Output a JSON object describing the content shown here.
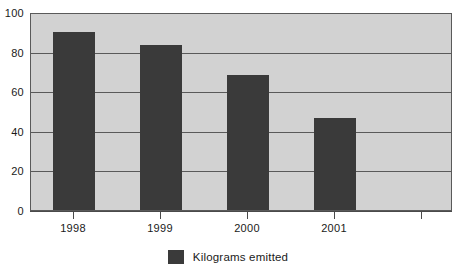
{
  "chart_data": {
    "type": "bar",
    "title": "",
    "subtitle": "",
    "xlabel": "",
    "ylabel": "",
    "categories": [
      "1998",
      "1999",
      "2000",
      "2001"
    ],
    "values": [
      91,
      84,
      69,
      47
    ],
    "series": [
      {
        "name": "Kilograms emitted",
        "values": [
          91,
          84,
          69,
          47
        ],
        "color": "#3a3a3a"
      }
    ],
    "ylim": [
      0,
      100
    ],
    "yticks": [
      0,
      20,
      40,
      60,
      80,
      100
    ],
    "ytick_labels": [
      "0",
      "20",
      "40",
      "60",
      "80",
      "100"
    ],
    "xtick_labels": [
      "1998",
      "1999",
      "2000",
      "2001"
    ],
    "empty_trailing_category": true,
    "grid": true,
    "grid_axis": "y",
    "legend": {
      "position": "bottom-center",
      "entries": [
        {
          "label": "Kilograms emitted",
          "color": "#3a3a3a"
        }
      ]
    },
    "plot_background": "#d2d2d2",
    "figure_background": "#ffffff",
    "axis_color": "#5a5a5a"
  },
  "legend": {
    "label": "Kilograms emitted"
  },
  "axes": {
    "y_labels": [
      "100",
      "80",
      "60",
      "40",
      "20",
      "0"
    ],
    "x_labels": [
      "1998",
      "1999",
      "2000",
      "2001"
    ]
  },
  "icons": {
    "legend_swatch": "filled-square-swatch"
  }
}
